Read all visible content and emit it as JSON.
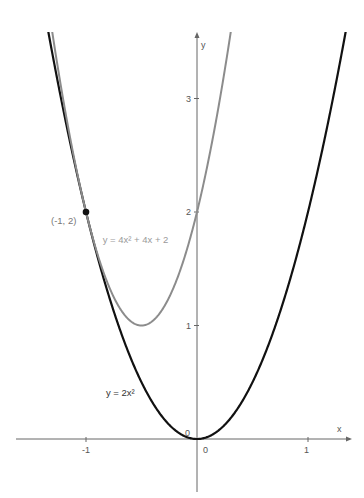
{
  "chart_data": {
    "type": "line",
    "title": "",
    "xlabel": "x",
    "ylabel": "y",
    "xlim": [
      -1.63,
      1.38
    ],
    "ylim": [
      -0.46,
      3.6
    ],
    "x_ticks": [
      "-1",
      "0",
      "1"
    ],
    "y_ticks": [
      "0",
      "1",
      "2",
      "3"
    ],
    "grid": false,
    "series": [
      {
        "name": "y = 2x²",
        "formula": {
          "a": 2,
          "b": 0,
          "c": 0
        },
        "color": "#111111",
        "label_pos": [
          -0.82,
          0.38
        ]
      },
      {
        "name": "y = 4x² + 4x + 2",
        "formula": {
          "a": 4,
          "b": 4,
          "c": 2
        },
        "color": "#8c8c8c",
        "label_pos": [
          -0.85,
          1.73
        ],
        "vertex": [
          -0.5,
          1
        ]
      }
    ],
    "points": [
      {
        "label": "(-1, 2)",
        "x": -1,
        "y": 2,
        "color": "#111111"
      }
    ],
    "annotations": [
      "(-1, 2)",
      "y = 4x² + 4x + 2",
      "y = 2x²"
    ]
  },
  "axes": {
    "x_label": "x",
    "y_label": "y",
    "origin_label_x": "0",
    "origin_label_y": "0"
  }
}
